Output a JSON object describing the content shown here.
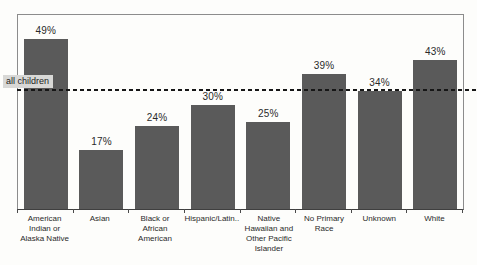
{
  "chart_data": {
    "type": "bar",
    "title": "",
    "xlabel": "",
    "ylabel": "",
    "categories": [
      "American Indian or Alaska Native",
      "Asian",
      "Black or African American",
      "Hispanic/Latin..",
      "Native Hawaiian and Other Pacific Islander",
      "No Primary Race",
      "Unknown",
      "White"
    ],
    "values": [
      49,
      17,
      24,
      30,
      25,
      39,
      34,
      43
    ],
    "value_labels": [
      "49%",
      "17%",
      "24%",
      "30%",
      "25%",
      "39%",
      "34%",
      "43%"
    ],
    "ylim": [
      0,
      56
    ],
    "grid": false,
    "legend": false,
    "reference_line": {
      "label": "all children",
      "value": 34.7
    },
    "colors": {
      "bar": "#5a5a5a",
      "reference_line": "#161616",
      "reference_label_bg": "#d8d8d6",
      "frame_border": "#8c8c8c",
      "axis_line": "#3f3f3f",
      "text": "#2a2a2a"
    }
  }
}
